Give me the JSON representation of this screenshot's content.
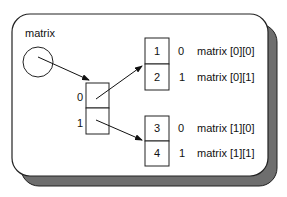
{
  "diagram": {
    "title_label": "matrix",
    "colors": {
      "panel_fill": "#ffffff",
      "panel_stroke": "#222222",
      "shadow_fill": "#6e6e6e",
      "line": "#111111"
    },
    "pointer_array": {
      "indices": [
        "0",
        "1"
      ]
    },
    "rows": [
      {
        "cells": [
          {
            "value": "1",
            "index": "0",
            "label": "matrix [0][0]"
          },
          {
            "value": "2",
            "index": "1",
            "label": "matrix [0][1]"
          }
        ]
      },
      {
        "cells": [
          {
            "value": "3",
            "index": "0",
            "label": "matrix [1][0]"
          },
          {
            "value": "4",
            "index": "1",
            "label": "matrix [1][1]"
          }
        ]
      }
    ]
  }
}
